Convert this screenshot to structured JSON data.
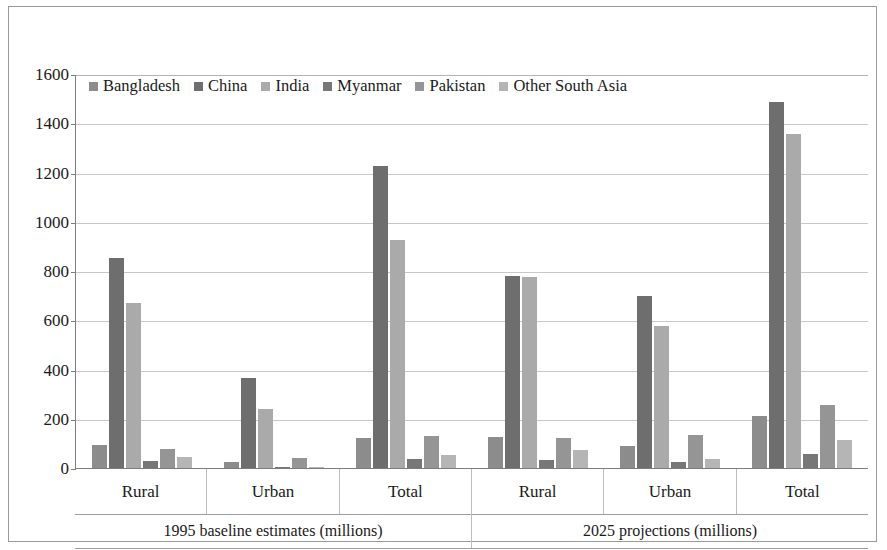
{
  "chart_data": {
    "type": "bar",
    "title": "",
    "xlabel": "",
    "ylabel": "",
    "ylim": [
      0,
      1600
    ],
    "ytick_step": 200,
    "yticks": [
      "1600",
      "1400",
      "1200",
      "1000",
      "800",
      "600",
      "400",
      "200",
      "0"
    ],
    "grid": true,
    "legend_position": "top-left-inside",
    "orientation": "vertical",
    "grouping": "clustered",
    "categories": [
      "Rural",
      "Urban",
      "Total",
      "Rural",
      "Urban",
      "Total"
    ],
    "group_headers": [
      "1995 baseline estimates (millions)",
      "2025 projections (millions)"
    ],
    "group_spans": [
      3,
      3
    ],
    "series": [
      {
        "name": "Bangladesh",
        "color": "#8c8c8c",
        "values": [
          95,
          25,
          123,
          125,
          88,
          213
        ]
      },
      {
        "name": "China",
        "color": "#6e6e6e",
        "values": [
          852,
          365,
          1225,
          780,
          700,
          1485
        ]
      },
      {
        "name": "India",
        "color": "#aaaaaa",
        "values": [
          672,
          240,
          925,
          775,
          575,
          1355
        ]
      },
      {
        "name": "Myanmar",
        "color": "#777777",
        "values": [
          30,
          5,
          35,
          32,
          25,
          55
        ]
      },
      {
        "name": "Pakistan",
        "color": "#959595",
        "values": [
          78,
          40,
          128,
          122,
          135,
          255
        ]
      },
      {
        "name": "Other South Asia",
        "color": "#b5b5b5",
        "values": [
          45,
          2,
          52,
          75,
          35,
          112
        ]
      }
    ]
  },
  "colors": {
    "frame_border": "#9a9a9a",
    "axis_line": "#7d7d7d",
    "gridline": "#c8c8c8",
    "text": "#161616"
  }
}
